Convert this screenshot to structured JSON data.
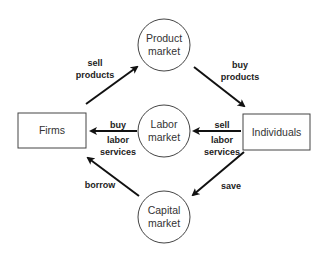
{
  "diagram": {
    "nodes": {
      "firms": {
        "label": "Firms",
        "shape": "box"
      },
      "individuals": {
        "label": "Individuals",
        "shape": "box"
      },
      "product_market": {
        "line1": "Product",
        "line2": "market",
        "shape": "circle"
      },
      "labor_market": {
        "line1": "Labor",
        "line2": "market",
        "shape": "circle"
      },
      "capital_market": {
        "line1": "Capital",
        "line2": "market",
        "shape": "circle"
      }
    },
    "edges": {
      "sell_products": {
        "from": "Firms",
        "to": "Product market",
        "line1": "sell",
        "line2": "products"
      },
      "buy_products": {
        "from": "Product market",
        "to": "Individuals",
        "line1": "buy",
        "line2": "products"
      },
      "buy_labor": {
        "from": "Labor market",
        "to": "Firms",
        "line1": "buy",
        "line2": "labor",
        "line3": "services"
      },
      "sell_labor": {
        "from": "Individuals",
        "to": "Labor market",
        "line1": "sell",
        "line2": "labor",
        "line3": "services"
      },
      "borrow": {
        "from": "Capital market",
        "to": "Firms",
        "label": "borrow"
      },
      "save": {
        "from": "Individuals",
        "to": "Capital market",
        "label": "save"
      }
    },
    "colors": {
      "stroke": "#222222",
      "background": "#ffffff"
    }
  }
}
